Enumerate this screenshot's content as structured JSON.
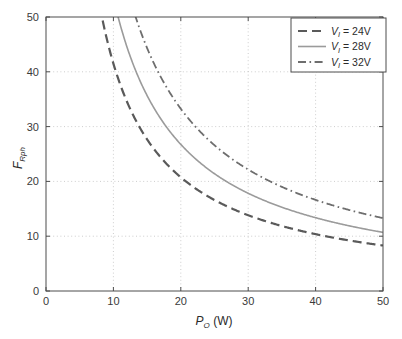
{
  "chart_data": {
    "type": "line",
    "title": "",
    "xlabel": "P_O (W)",
    "xlabel_main": "P",
    "xlabel_sub": "O",
    "xlabel_unit": " (W)",
    "ylabel": "F_Rph",
    "ylabel_main": "F",
    "ylabel_sub": "Rph",
    "xlim": [
      0,
      50
    ],
    "ylim": [
      0,
      50
    ],
    "xticks": [
      0,
      10,
      20,
      30,
      40,
      50
    ],
    "yticks": [
      0,
      10,
      20,
      30,
      40,
      50
    ],
    "xtick_labels": [
      "0",
      "10",
      "20",
      "30",
      "40",
      "50"
    ],
    "ytick_labels": [
      "0",
      "10",
      "20",
      "30",
      "40",
      "50"
    ],
    "grid": true,
    "grid_style": "dotted",
    "legend_position": "top-right",
    "series": [
      {
        "name": "V_I = 24V",
        "label_main": "V",
        "label_sub": "I",
        "label_rest": " = 24V",
        "style": "dashed",
        "color": "#5a5a5a",
        "width": 2.2,
        "k": 415,
        "x": [
          5,
          6,
          7,
          8,
          9,
          10,
          11,
          12,
          13,
          14,
          15,
          16,
          17,
          18,
          19,
          20,
          22,
          24,
          26,
          28,
          30,
          32,
          34,
          36,
          38,
          40,
          42,
          44,
          46,
          48,
          50
        ],
        "values": [
          83.0,
          69.2,
          59.3,
          51.9,
          46.1,
          41.5,
          37.7,
          34.6,
          31.9,
          29.6,
          27.7,
          25.9,
          24.4,
          23.1,
          21.8,
          20.8,
          18.9,
          17.3,
          16.0,
          14.8,
          13.8,
          13.0,
          12.2,
          11.5,
          10.9,
          10.4,
          9.9,
          9.4,
          9.0,
          8.6,
          8.3
        ]
      },
      {
        "name": "V_I = 28V",
        "label_main": "V",
        "label_sub": "I",
        "label_rest": " = 28V",
        "style": "solid",
        "color": "#9b9b9b",
        "width": 1.6,
        "k": 535,
        "x": [
          6,
          7,
          8,
          9,
          10,
          11,
          12,
          13,
          14,
          15,
          16,
          17,
          18,
          19,
          20,
          22,
          24,
          26,
          28,
          30,
          32,
          34,
          36,
          38,
          40,
          42,
          44,
          46,
          48,
          50
        ],
        "values": [
          89.2,
          76.4,
          66.9,
          59.4,
          53.5,
          48.6,
          44.6,
          41.2,
          38.2,
          35.7,
          33.4,
          31.5,
          29.7,
          28.2,
          26.8,
          24.3,
          22.3,
          20.6,
          19.1,
          17.8,
          16.7,
          15.7,
          14.9,
          14.1,
          13.4,
          12.7,
          12.2,
          11.6,
          11.1,
          10.7
        ]
      },
      {
        "name": "V_I = 32V",
        "label_main": "V",
        "label_sub": "I",
        "label_rest": " = 32V",
        "style": "dash-dot",
        "color": "#6e6e6e",
        "width": 1.8,
        "k": 665,
        "x": [
          8,
          9,
          10,
          11,
          12,
          13,
          14,
          15,
          16,
          17,
          18,
          19,
          20,
          22,
          24,
          26,
          28,
          30,
          32,
          34,
          36,
          38,
          40,
          42,
          44,
          46,
          48,
          50
        ],
        "values": [
          83.1,
          73.9,
          66.5,
          60.5,
          55.4,
          51.2,
          47.5,
          44.3,
          41.6,
          39.1,
          36.9,
          35.0,
          33.3,
          30.2,
          27.7,
          25.6,
          23.8,
          22.2,
          20.8,
          19.6,
          18.5,
          17.5,
          16.6,
          15.8,
          15.1,
          14.5,
          13.9,
          13.3
        ]
      }
    ]
  },
  "legend": {
    "items": [
      {
        "text_main": "V",
        "text_sub": "I",
        "text_rest": " = 24V"
      },
      {
        "text_main": "V",
        "text_sub": "I",
        "text_rest": " = 28V"
      },
      {
        "text_main": "V",
        "text_sub": "I",
        "text_rest": " = 32V"
      }
    ]
  },
  "colors": {
    "axis": "#4d4d4d",
    "grid": "#b8b8b8",
    "background": "#ffffff",
    "series_24v": "#5a5a5a",
    "series_28v": "#9b9b9b",
    "series_32v": "#6e6e6e"
  }
}
